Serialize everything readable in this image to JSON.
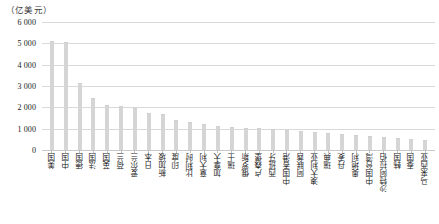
{
  "axis": {
    "unit_label": "（亿美元）",
    "y_ticks": [
      "6 000",
      "5 000",
      "4 000",
      "3 000",
      "2 000",
      "1 000",
      "0"
    ]
  },
  "caption": {
    "text": ""
  },
  "style": {
    "bar_color": "#d5d5d5",
    "grid_color": "#d9d9d9"
  },
  "chart_data": {
    "type": "bar",
    "title": "",
    "subtitle": "",
    "xlabel": "",
    "ylabel": "（亿美元）",
    "ylim": [
      0,
      6000
    ],
    "ytick_step": 1000,
    "grid": true,
    "legend": false,
    "categories": [
      "美国",
      "中国",
      "德国",
      "法国",
      "英国",
      "荷兰",
      "爱尔兰",
      "日本",
      "新加坡",
      "印度",
      "比利时",
      "意大利",
      "加拿大",
      "瑞士",
      "俄罗斯",
      "卢森堡",
      "西班牙",
      "中国香港",
      "阿联酋",
      "澳大利亚",
      "瑞典",
      "丹麦",
      "奥地利",
      "中国台湾",
      "沙特阿拉伯",
      "韩国",
      "泰国",
      "马来西亚"
    ],
    "values": [
      5050,
      5000,
      3100,
      2400,
      2050,
      2020,
      1900,
      1700,
      1620,
      1350,
      1250,
      1150,
      1100,
      1050,
      1000,
      980,
      940,
      900,
      860,
      800,
      760,
      700,
      660,
      600,
      560,
      520,
      470,
      420
    ]
  }
}
